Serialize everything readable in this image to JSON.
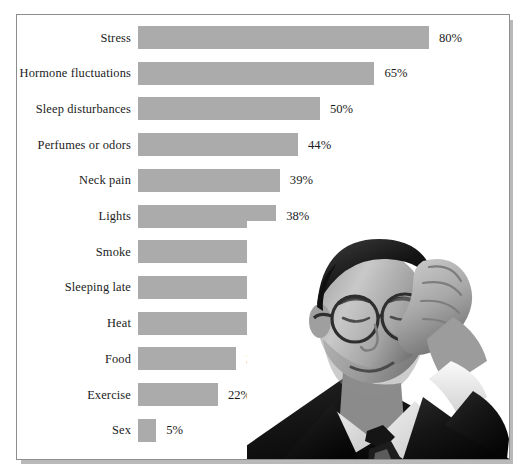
{
  "chart_data": {
    "type": "bar",
    "orientation": "horizontal",
    "title": "",
    "subtitle": "",
    "xlabel": "",
    "ylabel": "",
    "xlim": [
      0,
      80
    ],
    "grid": false,
    "legend": null,
    "value_suffix": "%",
    "bar_color": "#ababab",
    "categories": [
      "Stress",
      "Hormone fluctuations",
      "Sleep disturbances",
      "Perfumes or odors",
      "Neck pain",
      "Lights",
      "Smoke",
      "Sleeping late",
      "Heat",
      "Food",
      "Exercise",
      "Sex"
    ],
    "values": [
      80,
      65,
      50,
      44,
      39,
      38,
      36,
      32,
      30,
      27,
      22,
      5
    ],
    "value_labels": [
      "80%",
      "65%",
      "50%",
      "44%",
      "39%",
      "38%",
      "36%",
      "32%",
      "30%",
      "27%",
      "22%",
      "5%"
    ]
  },
  "figure": {
    "frame_border_color": "#8d8d8d",
    "background_color": "#ffffff",
    "text_color": "#1b1b1b"
  },
  "photo": {
    "alt": "Grayscale photograph of a man in a dark suit with glasses holding his hand to his temple",
    "name": "man-with-headache-photo"
  }
}
